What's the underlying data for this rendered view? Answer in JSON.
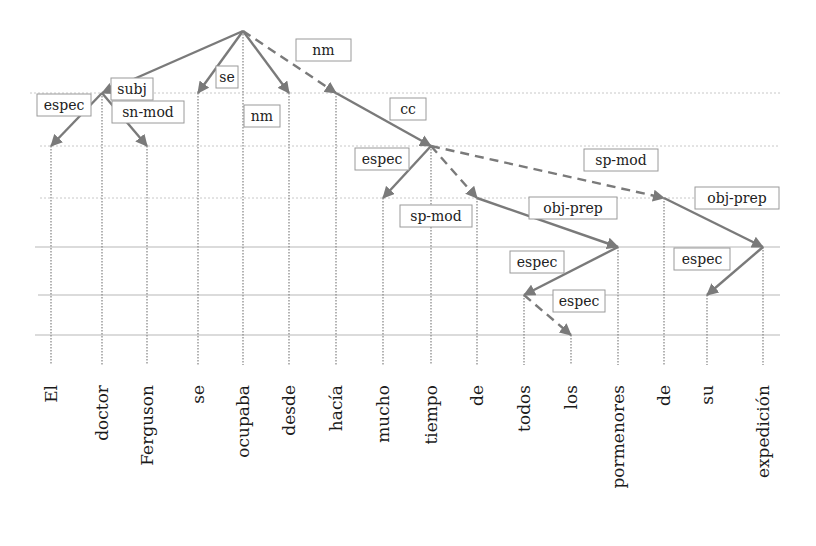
{
  "diagram": {
    "type": "dependency-tree",
    "colors": {
      "edge": "#7a7a7a",
      "grid_solid": "#b8b8b8",
      "grid_dotted": "#c8c8c8",
      "label_border": "#9a9a9a",
      "text": "#1a1a1a"
    },
    "levels": [
      31,
      93,
      146,
      198,
      247,
      295,
      335
    ],
    "grid_lines": [
      {
        "y": 93,
        "x1": 30,
        "x2": 780,
        "style": "dotted"
      },
      {
        "y": 146,
        "x1": 40,
        "x2": 780,
        "style": "dotted"
      },
      {
        "y": 198,
        "x1": 40,
        "x2": 780,
        "style": "dotted"
      },
      {
        "y": 247,
        "x1": 35,
        "x2": 780,
        "style": "solid"
      },
      {
        "y": 295,
        "x1": 38,
        "x2": 780,
        "style": "solid"
      },
      {
        "y": 335,
        "x1": 35,
        "x2": 780,
        "style": "solid"
      }
    ],
    "words": [
      {
        "id": 0,
        "text": "El",
        "x": 51,
        "node_y": 146
      },
      {
        "id": 1,
        "text": "doctor",
        "x": 102,
        "node_y": 93
      },
      {
        "id": 2,
        "text": "Ferguson",
        "x": 147,
        "node_y": 146
      },
      {
        "id": 3,
        "text": "se",
        "x": 198,
        "node_y": 93
      },
      {
        "id": 4,
        "text": "ocupaba",
        "x": 243,
        "node_y": 31
      },
      {
        "id": 5,
        "text": "desde",
        "x": 289,
        "node_y": 93
      },
      {
        "id": 6,
        "text": "hacía",
        "x": 336,
        "node_y": 93
      },
      {
        "id": 7,
        "text": "mucho",
        "x": 383,
        "node_y": 198
      },
      {
        "id": 8,
        "text": "tiempo",
        "x": 431,
        "node_y": 146
      },
      {
        "id": 9,
        "text": "de",
        "x": 477,
        "node_y": 198
      },
      {
        "id": 10,
        "text": "todos",
        "x": 524,
        "node_y": 295
      },
      {
        "id": 11,
        "text": "los",
        "x": 571,
        "node_y": 335
      },
      {
        "id": 12,
        "text": "pormenores",
        "x": 618,
        "node_y": 247
      },
      {
        "id": 13,
        "text": "de",
        "x": 664,
        "node_y": 198
      },
      {
        "id": 14,
        "text": "su",
        "x": 707,
        "node_y": 295
      },
      {
        "id": 15,
        "text": "expedición",
        "x": 763,
        "node_y": 247
      }
    ],
    "edges": [
      {
        "from": 4,
        "to": 1,
        "label": "subj",
        "dashed": false,
        "lx": 111,
        "ly": 78,
        "lw": 42
      },
      {
        "from": 4,
        "to": 3,
        "label": "se",
        "dashed": false,
        "lx": 216,
        "ly": 66,
        "lw": 22
      },
      {
        "from": 4,
        "to": 5,
        "label": "nm",
        "dashed": false,
        "lx": 244,
        "ly": 105,
        "lw": 36
      },
      {
        "from": 4,
        "to": 6,
        "label": "nm",
        "dashed": true,
        "lx": 296,
        "ly": 39,
        "lw": 55
      },
      {
        "from": 1,
        "to": 0,
        "label": "espec",
        "dashed": false,
        "lx": 37,
        "ly": 94,
        "lw": 54
      },
      {
        "from": 1,
        "to": 2,
        "label": "sn-mod",
        "dashed": false,
        "lx": 112,
        "ly": 101,
        "lw": 72
      },
      {
        "from": 6,
        "to": 8,
        "label": "cc",
        "dashed": false,
        "lx": 390,
        "ly": 98,
        "lw": 36
      },
      {
        "from": 8,
        "to": 7,
        "label": "espec",
        "dashed": false,
        "lx": 355,
        "ly": 148,
        "lw": 54
      },
      {
        "from": 8,
        "to": 9,
        "label": "sp-mod",
        "dashed": true,
        "lx": 400,
        "ly": 205,
        "lw": 72
      },
      {
        "from": 8,
        "to": 13,
        "label": "sp-mod",
        "dashed": true,
        "lx": 584,
        "ly": 149,
        "lw": 74
      },
      {
        "from": 9,
        "to": 12,
        "label": "obj-prep",
        "dashed": false,
        "lx": 529,
        "ly": 197,
        "lw": 88
      },
      {
        "from": 13,
        "to": 15,
        "label": "obj-prep",
        "dashed": false,
        "lx": 695,
        "ly": 187,
        "lw": 84
      },
      {
        "from": 12,
        "to": 10,
        "label": "espec",
        "dashed": false,
        "lx": 510,
        "ly": 251,
        "lw": 54
      },
      {
        "from": 15,
        "to": 14,
        "label": "espec",
        "dashed": false,
        "lx": 674,
        "ly": 248,
        "lw": 56
      },
      {
        "from": 10,
        "to": 11,
        "label": "espec",
        "dashed": true,
        "lx": 553,
        "ly": 290,
        "lw": 52
      }
    ],
    "baseline_y": 345,
    "words_top_y": 385
  }
}
